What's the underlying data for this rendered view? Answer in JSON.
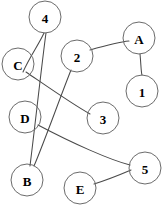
{
  "figure": {
    "title": "",
    "type": "node-link-graph",
    "width": 167,
    "height": 206,
    "background_color": "#ffffff",
    "node_stroke_color": "#6b6b6b",
    "edge_stroke_color": "#4a4a4a",
    "label_color": "#000000"
  },
  "nodes": [
    {
      "id": "4",
      "label": "4",
      "cx": 45,
      "cy": 17,
      "r": 16
    },
    {
      "id": "A",
      "label": "A",
      "cx": 139,
      "cy": 38,
      "r": 16
    },
    {
      "id": "C",
      "label": "C",
      "cx": 18,
      "cy": 64,
      "r": 16
    },
    {
      "id": "2",
      "label": "2",
      "cx": 77,
      "cy": 56,
      "r": 16
    },
    {
      "id": "1",
      "label": "1",
      "cx": 142,
      "cy": 91,
      "r": 16
    },
    {
      "id": "D",
      "label": "D",
      "cx": 25,
      "cy": 117,
      "r": 16
    },
    {
      "id": "3",
      "label": "3",
      "cx": 103,
      "cy": 118,
      "r": 16
    },
    {
      "id": "5",
      "label": "5",
      "cx": 145,
      "cy": 168,
      "r": 16
    },
    {
      "id": "B",
      "label": "B",
      "cx": 27,
      "cy": 180,
      "r": 16
    },
    {
      "id": "E",
      "label": "E",
      "cx": 80,
      "cy": 188,
      "r": 16
    }
  ],
  "edges": [
    {
      "from": "4",
      "to": "C",
      "path": "M 44 33 C 38 46 30 56 23 72"
    },
    {
      "from": "4",
      "to": "B",
      "path": "M 46 33 C 42 62 35 126 30 166"
    },
    {
      "from": "C",
      "to": "3",
      "path": "M 26 72 C 48 87 72 104 90 114"
    },
    {
      "from": "2",
      "to": "A",
      "path": "M 90 50 C 104 46 118 42 129 41"
    },
    {
      "from": "2",
      "to": "B",
      "path": "M 71 70 C 58 103 45 140 34 166"
    },
    {
      "from": "A",
      "to": "1",
      "path": "M 140 54 C 141 64 141 72 142 75"
    },
    {
      "from": "D",
      "to": "5",
      "path": "M 38 125 C 72 143 110 160 130 165"
    },
    {
      "from": "E",
      "to": "5",
      "path": "M 94 184 C 110 179 124 173 131 170"
    }
  ]
}
